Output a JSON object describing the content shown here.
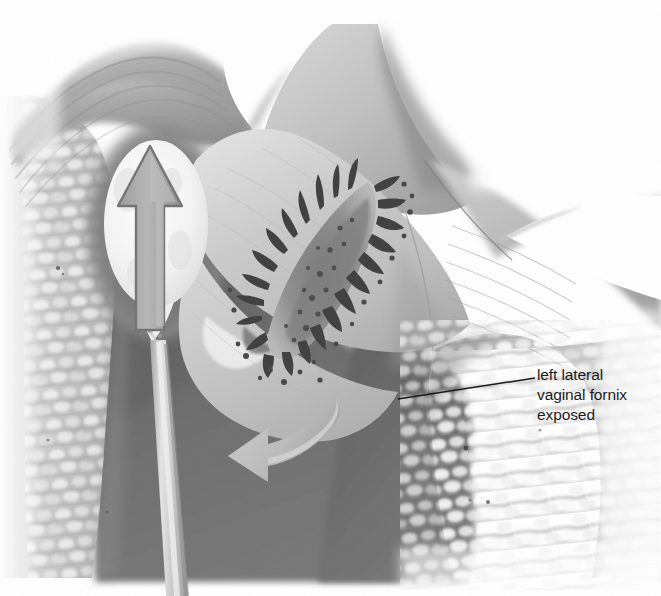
{
  "figure": {
    "marker": "(b)",
    "kind": "medical-illustration",
    "rendering": "grayscale airbrush medical drawing on white background",
    "width": 661,
    "height": 596
  },
  "annotations": [
    {
      "id": "left-lateral-fornix",
      "lines": [
        "left lateral",
        "vaginal fornix",
        "exposed"
      ],
      "text_x": 537,
      "text_y": 365,
      "leader": {
        "x1": 398,
        "y1": 399,
        "x2": 535,
        "y2": 378
      }
    }
  ],
  "structures": {
    "left_vaginal_wall": {
      "name": "left vaginal wall with rugae",
      "texture": "nodular cobblestone rugae",
      "fill": "#c9c9c9"
    },
    "right_vaginal_wall": {
      "name": "right vaginal wall with rugae",
      "texture": "nodular cobblestone rugae",
      "fill": "#c9c9c9"
    },
    "fornix_dome": {
      "name": "upper fornix dome with concentric ridges",
      "fill": "#9e9e9e"
    },
    "cervix_body": {
      "name": "cervix / portio vaginalis",
      "fill": "#c8c8c8"
    },
    "cervical_os": {
      "name": "cervical os with villous projections",
      "fill": "#8d8d8d"
    },
    "vaginal_canal_shadow": {
      "name": "dark vaginal canal recess",
      "fill": "#6a6a6a"
    },
    "exposed_fornix_recess": {
      "name": "exposed left lateral vaginal fornix (dark recess)",
      "fill": "#6e6e6e"
    },
    "swab_tip": {
      "name": "cotton swab tip",
      "fill": "#fbfbfb"
    },
    "swab_stick": {
      "name": "swab applicator stick",
      "fill": "#c4c4c4"
    },
    "right_notch": {
      "name": "white wedge notch at right margin",
      "fill": "#ffffff"
    }
  },
  "direction_arrows": [
    {
      "id": "swab-push-arrow",
      "name": "straight arrow in swab tip",
      "direction": "up",
      "fill": "#a8a8a8",
      "stroke": "#6f6f6f"
    },
    {
      "id": "tissue-rotation-arrow",
      "name": "curved arrow indicating tissue displacement",
      "direction": "curving left and down",
      "fill": "#bdbdbd"
    }
  ],
  "palette": {
    "background": "#ffffff",
    "ink": "#1a1a1a",
    "light_tissue": "#cfcfcf",
    "mid_tissue": "#a6a6a6",
    "dark_cavity": "#6a6a6a",
    "deep_shadow": "#4f4f4f",
    "highlight": "#f6f6f6",
    "arrow_light": "#b6b6b6"
  }
}
